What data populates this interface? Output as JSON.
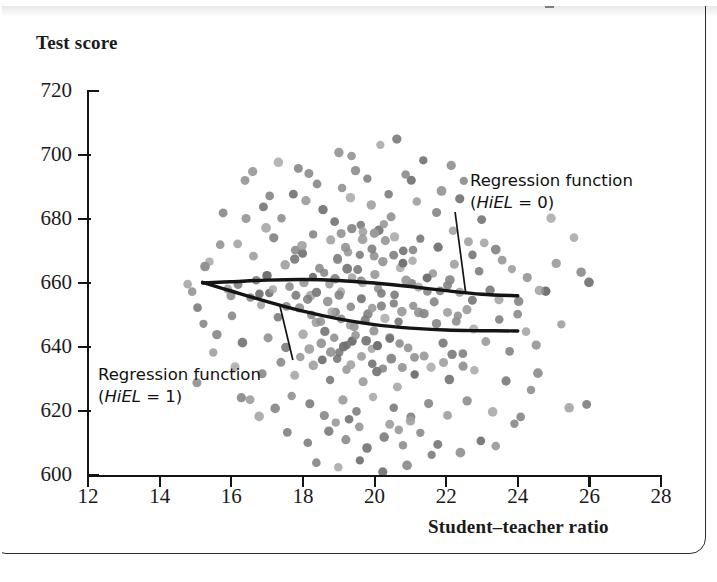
{
  "figure": {
    "y_title": "Test score",
    "x_title": "Student–teacher ratio"
  },
  "annotations": [
    {
      "id": "hiel0",
      "line1": "Regression function",
      "line2_pre": "(",
      "line2_var": "HiEL",
      "line2_post": " = 0)"
    },
    {
      "id": "hiel1",
      "line1": "Regression function",
      "line2_pre": "(",
      "line2_var": "HiEL",
      "line2_post": " = 1)"
    }
  ],
  "chart_data": {
    "type": "scatter",
    "title": "",
    "xlabel": "Student–teacher ratio",
    "ylabel": "Test score",
    "xlim": [
      12,
      28
    ],
    "ylim": [
      600,
      720
    ],
    "xticks": [
      12,
      14,
      16,
      18,
      20,
      22,
      24,
      26,
      28
    ],
    "yticks": [
      600,
      620,
      640,
      660,
      680,
      700,
      720
    ],
    "grid": false,
    "legend": "none",
    "marker": {
      "shape": "circle",
      "size_px": 9,
      "color": "#7d7d7d",
      "alpha": 0.85
    },
    "points": [
      [
        17.3,
        698
      ],
      [
        17.9,
        696
      ],
      [
        19.0,
        701
      ],
      [
        19.4,
        700
      ],
      [
        20.2,
        703
      ],
      [
        20.6,
        705
      ],
      [
        21.4,
        698
      ],
      [
        22.1,
        697
      ],
      [
        16.4,
        692
      ],
      [
        17.7,
        688
      ],
      [
        18.4,
        691
      ],
      [
        19.1,
        690
      ],
      [
        19.8,
        693
      ],
      [
        20.4,
        688
      ],
      [
        21.0,
        692
      ],
      [
        21.9,
        689
      ],
      [
        15.8,
        682
      ],
      [
        16.9,
        684
      ],
      [
        17.4,
        680
      ],
      [
        18.1,
        686
      ],
      [
        18.6,
        683
      ],
      [
        19.3,
        687
      ],
      [
        19.9,
        684
      ],
      [
        20.5,
        681
      ],
      [
        21.2,
        685
      ],
      [
        21.7,
        682
      ],
      [
        22.4,
        686
      ],
      [
        23.0,
        680
      ],
      [
        18.9,
        679
      ],
      [
        19.6,
        678
      ],
      [
        20.1,
        676
      ],
      [
        17.0,
        677
      ],
      [
        16.2,
        672
      ],
      [
        17.2,
        674
      ],
      [
        17.8,
        670
      ],
      [
        18.3,
        675
      ],
      [
        18.8,
        673
      ],
      [
        19.2,
        671
      ],
      [
        19.7,
        676
      ],
      [
        20.3,
        673
      ],
      [
        20.8,
        670
      ],
      [
        21.3,
        674
      ],
      [
        21.8,
        671
      ],
      [
        22.6,
        673
      ],
      [
        23.4,
        670
      ],
      [
        15.4,
        667
      ],
      [
        16.6,
        668
      ],
      [
        17.5,
        666
      ],
      [
        18.0,
        669
      ],
      [
        18.5,
        665
      ],
      [
        19.0,
        667
      ],
      [
        19.5,
        664
      ],
      [
        20.0,
        668
      ],
      [
        20.7,
        665
      ],
      [
        21.1,
        667
      ],
      [
        21.6,
        663
      ],
      [
        22.2,
        666
      ],
      [
        22.9,
        664
      ],
      [
        23.6,
        667
      ],
      [
        24.3,
        662
      ],
      [
        25.1,
        666
      ],
      [
        25.8,
        663
      ],
      [
        14.8,
        660
      ],
      [
        15.9,
        658
      ],
      [
        16.7,
        661
      ],
      [
        17.1,
        657
      ],
      [
        17.6,
        659
      ],
      [
        18.2,
        656
      ],
      [
        18.7,
        660
      ],
      [
        19.1,
        657
      ],
      [
        19.6,
        661
      ],
      [
        20.1,
        658
      ],
      [
        20.6,
        656
      ],
      [
        21.0,
        660
      ],
      [
        21.5,
        657
      ],
      [
        22.0,
        659
      ],
      [
        22.7,
        655
      ],
      [
        23.2,
        658
      ],
      [
        24.0,
        654
      ],
      [
        24.8,
        657
      ],
      [
        15.1,
        652
      ],
      [
        16.0,
        650
      ],
      [
        16.8,
        653
      ],
      [
        17.3,
        649
      ],
      [
        17.9,
        652
      ],
      [
        18.4,
        648
      ],
      [
        18.9,
        651
      ],
      [
        19.3,
        647
      ],
      [
        19.8,
        650
      ],
      [
        20.2,
        653
      ],
      [
        20.7,
        648
      ],
      [
        21.2,
        651
      ],
      [
        21.7,
        647
      ],
      [
        22.3,
        650
      ],
      [
        22.8,
        646
      ],
      [
        23.5,
        649
      ],
      [
        24.2,
        645
      ],
      [
        15.6,
        644
      ],
      [
        16.3,
        641
      ],
      [
        17.0,
        643
      ],
      [
        17.5,
        640
      ],
      [
        18.0,
        644
      ],
      [
        18.5,
        641
      ],
      [
        19.0,
        638
      ],
      [
        19.4,
        642
      ],
      [
        19.9,
        639
      ],
      [
        20.4,
        643
      ],
      [
        20.9,
        640
      ],
      [
        21.4,
        637
      ],
      [
        21.9,
        641
      ],
      [
        22.5,
        638
      ],
      [
        23.1,
        642
      ],
      [
        23.8,
        639
      ],
      [
        16.1,
        634
      ],
      [
        16.9,
        632
      ],
      [
        17.4,
        635
      ],
      [
        17.8,
        631
      ],
      [
        18.3,
        634
      ],
      [
        18.8,
        630
      ],
      [
        19.2,
        633
      ],
      [
        19.7,
        629
      ],
      [
        20.1,
        632
      ],
      [
        20.6,
        628
      ],
      [
        21.1,
        631
      ],
      [
        21.6,
        634
      ],
      [
        22.1,
        630
      ],
      [
        22.8,
        633
      ],
      [
        23.7,
        629
      ],
      [
        24.6,
        632
      ],
      [
        16.5,
        624
      ],
      [
        17.2,
        621
      ],
      [
        17.7,
        625
      ],
      [
        18.2,
        622
      ],
      [
        18.6,
        619
      ],
      [
        19.1,
        623
      ],
      [
        19.5,
        620
      ],
      [
        20.0,
        624
      ],
      [
        20.5,
        621
      ],
      [
        21.0,
        618
      ],
      [
        21.5,
        622
      ],
      [
        22.0,
        619
      ],
      [
        22.6,
        623
      ],
      [
        23.3,
        620
      ],
      [
        24.1,
        618
      ],
      [
        25.4,
        621
      ],
      [
        17.6,
        613
      ],
      [
        18.1,
        610
      ],
      [
        18.7,
        614
      ],
      [
        19.2,
        611
      ],
      [
        19.8,
        608
      ],
      [
        20.3,
        612
      ],
      [
        20.8,
        609
      ],
      [
        21.3,
        613
      ],
      [
        21.8,
        610
      ],
      [
        22.4,
        607
      ],
      [
        23.0,
        611
      ],
      [
        18.4,
        604
      ],
      [
        19.0,
        602
      ],
      [
        19.6,
        605
      ],
      [
        20.2,
        601
      ],
      [
        20.9,
        603
      ],
      [
        21.6,
        606
      ],
      [
        16.6,
        695
      ],
      [
        18.2,
        694
      ],
      [
        19.5,
        695
      ],
      [
        20.9,
        694
      ],
      [
        22.5,
        692
      ],
      [
        18.0,
        660
      ],
      [
        18.3,
        662
      ],
      [
        18.6,
        663
      ],
      [
        18.9,
        661
      ],
      [
        19.2,
        664
      ],
      [
        19.4,
        662
      ],
      [
        19.7,
        660
      ],
      [
        20.0,
        663
      ],
      [
        18.1,
        655
      ],
      [
        18.4,
        657
      ],
      [
        18.7,
        654
      ],
      [
        19.0,
        656
      ],
      [
        19.3,
        653
      ],
      [
        19.6,
        655
      ],
      [
        19.9,
        652
      ],
      [
        20.2,
        657
      ],
      [
        18.2,
        650
      ],
      [
        18.5,
        648
      ],
      [
        18.8,
        651
      ],
      [
        19.1,
        649
      ],
      [
        19.4,
        646
      ],
      [
        19.7,
        648
      ],
      [
        20.0,
        645
      ],
      [
        20.3,
        649
      ],
      [
        18.6,
        645
      ],
      [
        18.9,
        643
      ],
      [
        19.2,
        641
      ],
      [
        19.5,
        644
      ],
      [
        19.8,
        642
      ],
      [
        20.1,
        640
      ],
      [
        20.4,
        643
      ],
      [
        20.7,
        641
      ],
      [
        19.0,
        668
      ],
      [
        19.3,
        670
      ],
      [
        19.6,
        669
      ],
      [
        19.9,
        671
      ],
      [
        20.2,
        667
      ],
      [
        20.5,
        669
      ],
      [
        20.8,
        666
      ],
      [
        21.1,
        670
      ],
      [
        19.1,
        675
      ],
      [
        19.4,
        677
      ],
      [
        19.7,
        674
      ],
      [
        20.0,
        676
      ],
      [
        20.3,
        678
      ],
      [
        20.6,
        674
      ],
      [
        17.8,
        667
      ],
      [
        18.0,
        672
      ],
      [
        17.5,
        653
      ],
      [
        17.8,
        656
      ],
      [
        17.2,
        658
      ],
      [
        17.0,
        662
      ],
      [
        16.8,
        657
      ],
      [
        16.5,
        655
      ],
      [
        16.2,
        660
      ],
      [
        16.0,
        656
      ],
      [
        20.9,
        661
      ],
      [
        21.2,
        659
      ],
      [
        21.5,
        662
      ],
      [
        21.8,
        658
      ],
      [
        22.1,
        661
      ],
      [
        22.4,
        657
      ],
      [
        20.5,
        654
      ],
      [
        20.8,
        651
      ],
      [
        21.1,
        653
      ],
      [
        21.4,
        650
      ],
      [
        21.7,
        654
      ],
      [
        22.0,
        651
      ],
      [
        22.3,
        648
      ],
      [
        22.6,
        652
      ],
      [
        19.0,
        636
      ],
      [
        19.3,
        634
      ],
      [
        19.6,
        637
      ],
      [
        19.9,
        635
      ],
      [
        20.2,
        633
      ],
      [
        20.5,
        636
      ],
      [
        20.8,
        634
      ],
      [
        21.1,
        637
      ],
      [
        17.9,
        637
      ],
      [
        18.2,
        639
      ],
      [
        18.5,
        636
      ],
      [
        18.8,
        638
      ],
      [
        19.1,
        640
      ],
      [
        21.9,
        635
      ],
      [
        22.2,
        638
      ],
      [
        22.5,
        634
      ],
      [
        20.4,
        616
      ],
      [
        20.7,
        614
      ],
      [
        21.0,
        617
      ],
      [
        19.3,
        617
      ],
      [
        19.6,
        615
      ],
      [
        18.9,
        616
      ],
      [
        24.9,
        680
      ],
      [
        25.6,
        674
      ],
      [
        26.0,
        660
      ],
      [
        25.2,
        647
      ],
      [
        24.5,
        641
      ],
      [
        25.9,
        622
      ],
      [
        24.4,
        627
      ],
      [
        23.9,
        616
      ],
      [
        23.4,
        609
      ],
      [
        15.2,
        647
      ],
      [
        15.5,
        638
      ],
      [
        15.0,
        629
      ],
      [
        16.3,
        624
      ],
      [
        16.8,
        618
      ],
      [
        15.7,
        672
      ],
      [
        16.4,
        680
      ],
      [
        17.1,
        687
      ],
      [
        14.9,
        657
      ],
      [
        15.3,
        665
      ],
      [
        22.7,
        669
      ],
      [
        23.1,
        673
      ],
      [
        23.8,
        664
      ],
      [
        24.6,
        658
      ],
      [
        22.2,
        676
      ],
      [
        23.5,
        655
      ],
      [
        24.0,
        650
      ]
    ],
    "regression_curves": [
      {
        "name": "Regression function (HiEL = 0)",
        "color": "#141414",
        "points": [
          [
            15.2,
            660.0
          ],
          [
            16.0,
            660.4
          ],
          [
            17.0,
            660.9
          ],
          [
            18.0,
            661.1
          ],
          [
            19.0,
            660.8
          ],
          [
            20.0,
            660.0
          ],
          [
            21.0,
            658.9
          ],
          [
            22.0,
            657.6
          ],
          [
            23.0,
            656.5
          ],
          [
            24.0,
            656.0
          ]
        ]
      },
      {
        "name": "Regression function (HiEL = 1)",
        "color": "#141414",
        "points": [
          [
            15.2,
            660.2
          ],
          [
            16.0,
            657.5
          ],
          [
            17.0,
            654.2
          ],
          [
            18.0,
            651.2
          ],
          [
            19.0,
            648.8
          ],
          [
            20.0,
            647.0
          ],
          [
            21.0,
            645.9
          ],
          [
            22.0,
            645.3
          ],
          [
            23.0,
            645.1
          ],
          [
            24.0,
            645.0
          ]
        ]
      }
    ]
  }
}
